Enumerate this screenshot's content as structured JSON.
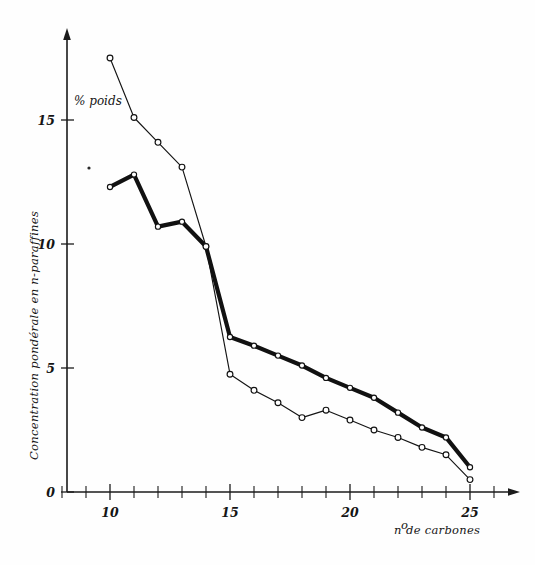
{
  "chart_data": {
    "type": "line",
    "title": "",
    "subtitle": "",
    "xlabel": "n° de carbones",
    "ylabel": "Concentration pondérale en n-paraffines",
    "yunit": "% poids",
    "xlim": [
      8,
      26.5
    ],
    "ylim": [
      0,
      18.6
    ],
    "xticks": [
      10,
      15,
      20,
      25
    ],
    "xticklabels": [
      "10",
      "15",
      "20",
      "25"
    ],
    "xticks_minor": [
      8,
      9,
      11,
      12,
      13,
      14,
      16,
      17,
      18,
      19,
      21,
      22,
      23,
      24,
      26
    ],
    "yticks": [
      0,
      5,
      10,
      15
    ],
    "yticklabels": [
      "0",
      "5",
      "10",
      "15"
    ],
    "grid": false,
    "legend": "none",
    "x": [
      10,
      11,
      12,
      13,
      14,
      15,
      16,
      17,
      18,
      19,
      20,
      21,
      22,
      23,
      24,
      25
    ],
    "series": [
      {
        "name": "courbe-fine",
        "style": "thin",
        "markers": "open-circle",
        "values": [
          17.5,
          15.1,
          14.1,
          13.1,
          9.9,
          4.75,
          4.1,
          3.6,
          3.0,
          3.3,
          2.9,
          2.5,
          2.2,
          1.8,
          1.5,
          0.5
        ]
      },
      {
        "name": "courbe-epaisse",
        "style": "thick",
        "markers": "open-circle",
        "values": [
          12.3,
          12.8,
          10.7,
          10.9,
          9.9,
          6.25,
          5.9,
          5.5,
          5.1,
          4.6,
          4.2,
          3.8,
          3.2,
          2.6,
          2.2,
          1.0
        ]
      }
    ],
    "colors": {
      "line": "#121212",
      "marker_fill": "#ffffff",
      "axis": "#1b1b1b",
      "background": "#fefefe"
    }
  },
  "axes": {
    "y_unit_label": "% poids",
    "y_axis_title": "Concentration pondérale en n-paraffines",
    "x_axis_title": "n° de carbones",
    "x_axis_title_prefix": "n",
    "x_axis_title_sup": "o",
    "x_axis_title_rest": " de carbones"
  },
  "ticks": {
    "y": [
      "15",
      "10",
      "5",
      "0"
    ],
    "x": [
      "10",
      "15",
      "20",
      "25"
    ]
  }
}
